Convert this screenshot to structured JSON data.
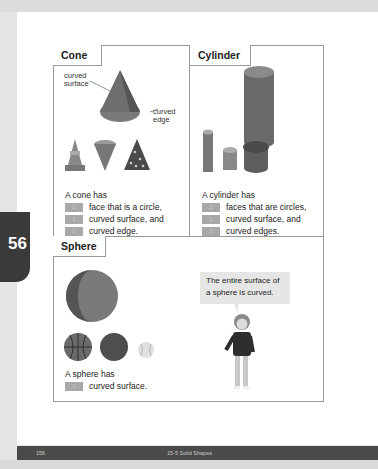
{
  "side_tab": {
    "page_fragment": "56"
  },
  "sections": {
    "cone": {
      "title": "Cone",
      "label_surface": "curved surface",
      "label_edge": "curved edge",
      "intro": "A cone has",
      "items": [
        {
          "value": "1",
          "text": "face that is a circle,"
        },
        {
          "value": "1",
          "text": "curved surface, and"
        },
        {
          "value": "1",
          "text": "curved edge."
        }
      ]
    },
    "cylinder": {
      "title": "Cylinder",
      "intro": "A cylinder has",
      "items": [
        {
          "value": "2",
          "text": "faces that are circles,"
        },
        {
          "value": "1",
          "text": "curved surface, and"
        },
        {
          "value": "2",
          "text": "curved edges."
        }
      ]
    },
    "sphere": {
      "title": "Sphere",
      "intro": "A sphere has",
      "items": [
        {
          "value": "1",
          "text": "curved surface."
        }
      ],
      "speech_bubble": "The entire surface of a sphere is curved."
    }
  },
  "footer": {
    "page_number": "156",
    "chapter": "15-5  Solid Shapes"
  },
  "colors": {
    "shape_fill": "#7a7a7a",
    "shape_dark": "#5a5a5a",
    "answer_slot": "#a8a8a8",
    "footer_bg": "#4a4a4a"
  }
}
